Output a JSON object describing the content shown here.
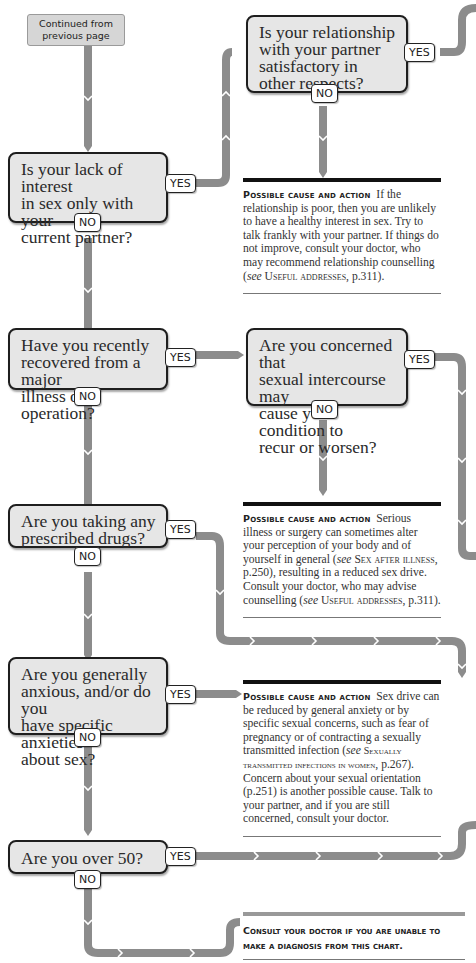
{
  "colors": {
    "connector": "#8c8c8c",
    "box_fill": "#e6e6e6",
    "box_border": "#1e1e1e",
    "rule_dark": "#111111",
    "rule_light": "#999999"
  },
  "start": {
    "line1": "Continued from",
    "line2": "previous page"
  },
  "questions": [
    {
      "id": "q1",
      "lines": [
        "Is your lack of interest",
        "in sex only with your",
        "current partner?"
      ],
      "yes": "YES",
      "no": "NO"
    },
    {
      "id": "q1a",
      "lines": [
        "Is your relationship",
        "with your partner",
        "satisfactory in",
        "other respects?"
      ],
      "yes": "YES",
      "no": "NO"
    },
    {
      "id": "q2",
      "lines": [
        "Have you recently",
        "recovered from a major",
        "illness or operation?"
      ],
      "yes": "YES",
      "no": "NO"
    },
    {
      "id": "q2a",
      "lines": [
        "Are you concerned that",
        "sexual intercourse may",
        "cause your condition to",
        "recur or worsen?"
      ],
      "yes": "YES",
      "no": "NO"
    },
    {
      "id": "q3",
      "lines": [
        "Are you taking any",
        "prescribed drugs?"
      ],
      "yes": "YES",
      "no": "NO"
    },
    {
      "id": "q4",
      "lines": [
        "Are you generally",
        "anxious, and/or do you",
        "have specific anxieties",
        "about sex?"
      ],
      "yes": "YES",
      "no": "NO"
    },
    {
      "id": "q5",
      "lines": [
        "Are you over 50?"
      ],
      "yes": "YES",
      "no": "NO"
    }
  ],
  "causes": [
    {
      "heading": "Possible cause and action",
      "text_a": "If the relationship is poor, then you are unlikely to have a healthy interest in sex. Try to talk frankly with your partner. If things do not improve, consult your doctor, who may recommend relationship counselling (",
      "see": "see",
      "ref": "Useful addresses",
      "text_b": ", p.311)."
    },
    {
      "heading": "Possible cause and action",
      "text_a": "Serious illness or surgery can sometimes alter your perception of your body and of yourself in general (",
      "see1": "see",
      "ref1": "Sex after illness",
      "text_b": ", p.250), resulting in a reduced sex drive. Consult your doctor, who may advise counselling (",
      "see2": "see",
      "ref2": "Useful addresses",
      "text_c": ", p.311)."
    },
    {
      "heading": "Possible cause and action",
      "text_a": "Sex drive can be reduced by general anxiety or by specific sexual concerns, such as fear of pregnancy or of contracting a sexually transmitted infection (",
      "see": "see",
      "ref": "Sexually transmitted infections in women",
      "text_b": ", p.267). Concern about your sexual orientation (p.251) is another possible cause. Talk to your partner, and if you are still concerned, consult your doctor."
    }
  ],
  "final": {
    "line1": "Consult your doctor if you are unable to",
    "line2": "make a diagnosis from this chart."
  }
}
